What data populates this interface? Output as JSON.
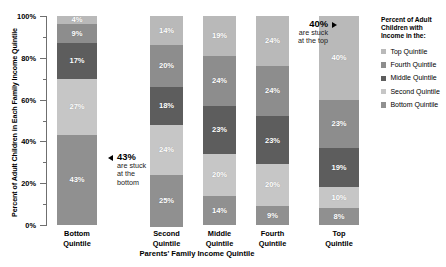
{
  "chart_data": {
    "type": "bar",
    "subtype": "stacked-bar-100",
    "title": "",
    "xlabel": "Parents' Family Income Quintile",
    "ylabel": "Percent of Adult Children in Each Family Income Quintile",
    "ylim": [
      0,
      100
    ],
    "ytick_labels": [
      "0%",
      "20%",
      "40%",
      "60%",
      "80%",
      "100%"
    ],
    "ytick_values": [
      0,
      20,
      40,
      60,
      80,
      100
    ],
    "grid": false,
    "legend_position": "right",
    "legend_title": "Percent of Adult Children with Income in the:",
    "categories": [
      "Bottom Quintile",
      "Second Quintile",
      "Middle Quintile",
      "Fourth Quintile",
      "Top Quintile"
    ],
    "series": [
      {
        "name": "Top Quintile",
        "color": "#b9b9b9",
        "values": [
          4,
          14,
          19,
          24,
          40
        ]
      },
      {
        "name": "Fourth Quintile",
        "color": "#8d8d8d",
        "values": [
          9,
          20,
          24,
          24,
          23
        ]
      },
      {
        "name": "Middle Quintile",
        "color": "#5d5d5d",
        "values": [
          17,
          18,
          23,
          23,
          19
        ]
      },
      {
        "name": "Second Quintile",
        "color": "#c6c6c6",
        "values": [
          27,
          24,
          20,
          20,
          10
        ]
      },
      {
        "name": "Bottom Quintile",
        "color": "#909090",
        "values": [
          43,
          25,
          14,
          9,
          8
        ]
      }
    ],
    "annotations": [
      {
        "big": "43%",
        "line1": "are stuck",
        "line2": "at the",
        "line3": "bottom",
        "target": "Bottom Quintile / Bottom Quintile segment"
      },
      {
        "big": "40%",
        "line1": "are stuck",
        "line2": "at the top",
        "line3": "",
        "target": "Top Quintile / Top Quintile segment"
      }
    ]
  },
  "bars": [
    {
      "label_line1": "Bottom",
      "label_line2": "Quintile",
      "segments": [
        {
          "label": "4%",
          "value": 4,
          "series": "Top Quintile",
          "color": "#b9b9b9"
        },
        {
          "label": "9%",
          "value": 9,
          "series": "Fourth Quintile",
          "color": "#8d8d8d"
        },
        {
          "label": "17%",
          "value": 17,
          "series": "Middle Quintile",
          "color": "#5d5d5d"
        },
        {
          "label": "27%",
          "value": 27,
          "series": "Second Quintile",
          "color": "#c6c6c6"
        },
        {
          "label": "43%",
          "value": 43,
          "series": "Bottom Quintile",
          "color": "#909090"
        }
      ]
    },
    {
      "label_line1": "Second",
      "label_line2": "Quintile",
      "segments": [
        {
          "label": "14%",
          "value": 14,
          "series": "Top Quintile",
          "color": "#b9b9b9"
        },
        {
          "label": "20%",
          "value": 20,
          "series": "Fourth Quintile",
          "color": "#8d8d8d"
        },
        {
          "label": "18%",
          "value": 18,
          "series": "Middle Quintile",
          "color": "#5d5d5d"
        },
        {
          "label": "24%",
          "value": 24,
          "series": "Second Quintile",
          "color": "#c6c6c6"
        },
        {
          "label": "25%",
          "value": 25,
          "series": "Bottom Quintile",
          "color": "#909090"
        }
      ]
    },
    {
      "label_line1": "Middle",
      "label_line2": "Quintile",
      "segments": [
        {
          "label": "19%",
          "value": 19,
          "series": "Top Quintile",
          "color": "#b9b9b9"
        },
        {
          "label": "24%",
          "value": 24,
          "series": "Fourth Quintile",
          "color": "#8d8d8d"
        },
        {
          "label": "23%",
          "value": 23,
          "series": "Middle Quintile",
          "color": "#5d5d5d"
        },
        {
          "label": "20%",
          "value": 20,
          "series": "Second Quintile",
          "color": "#c6c6c6"
        },
        {
          "label": "14%",
          "value": 14,
          "series": "Bottom Quintile",
          "color": "#909090"
        }
      ]
    },
    {
      "label_line1": "Fourth",
      "label_line2": "Quintile",
      "segments": [
        {
          "label": "24%",
          "value": 24,
          "series": "Top Quintile",
          "color": "#b9b9b9"
        },
        {
          "label": "24%",
          "value": 24,
          "series": "Fourth Quintile",
          "color": "#8d8d8d"
        },
        {
          "label": "23%",
          "value": 23,
          "series": "Middle Quintile",
          "color": "#5d5d5d"
        },
        {
          "label": "20%",
          "value": 20,
          "series": "Second Quintile",
          "color": "#c6c6c6"
        },
        {
          "label": "9%",
          "value": 9,
          "series": "Bottom Quintile",
          "color": "#909090"
        }
      ]
    },
    {
      "label_line1": "Top",
      "label_line2": "Quintile",
      "segments": [
        {
          "label": "40%",
          "value": 40,
          "series": "Top Quintile",
          "color": "#b9b9b9"
        },
        {
          "label": "23%",
          "value": 23,
          "series": "Fourth Quintile",
          "color": "#8d8d8d"
        },
        {
          "label": "19%",
          "value": 19,
          "series": "Middle Quintile",
          "color": "#5d5d5d"
        },
        {
          "label": "10%",
          "value": 10,
          "series": "Second Quintile",
          "color": "#c6c6c6"
        },
        {
          "label": "8%",
          "value": 8,
          "series": "Bottom Quintile",
          "color": "#909090"
        }
      ]
    }
  ],
  "yaxis": {
    "labels": [
      "100%",
      "80%",
      "60%",
      "40%",
      "20%",
      "0%"
    ]
  },
  "axis_titles": {
    "y": "Percent of Adult Children in Each Family Income Quintile",
    "x": "Parents' Family Income Quintile"
  },
  "legend": {
    "title_line1": "Percent of Adult",
    "title_line2": "Children with",
    "title_line3": "Income in the:",
    "items": [
      {
        "label": "Top Quintile",
        "color": "#b9b9b9"
      },
      {
        "label": "Fourth Quintile",
        "color": "#8d8d8d"
      },
      {
        "label": "Middle Quintile",
        "color": "#5d5d5d"
      },
      {
        "label": "Second Quintile",
        "color": "#c6c6c6"
      },
      {
        "label": "Bottom Quintile",
        "color": "#909090"
      }
    ]
  },
  "callouts": {
    "bottom": {
      "big": "43%",
      "line1": "are stuck",
      "line2": "at the",
      "line3": "bottom"
    },
    "top": {
      "big": "40%",
      "line1": "are stuck",
      "line2": "at the top"
    }
  }
}
